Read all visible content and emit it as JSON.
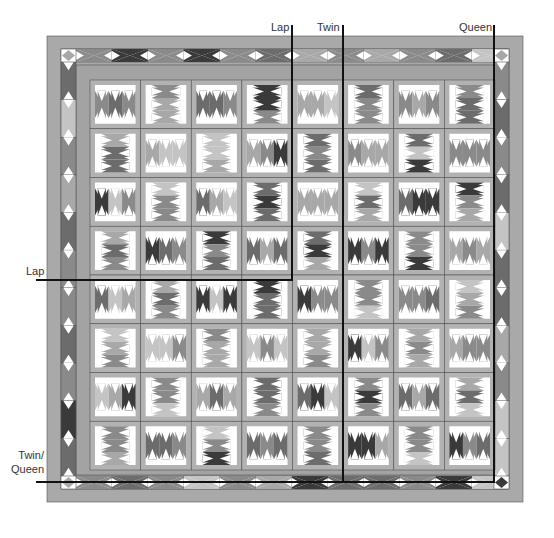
{
  "diagram": {
    "colors": {
      "outer_border": "#a9a9a9",
      "inner_border": "#a3a3a3",
      "sashing": "#b2b2b2",
      "background_white": "#ffffff",
      "light": "#c4c4c4",
      "medium_light": "#a8a8a8",
      "medium": "#8a8a8a",
      "medium_dark": "#6c6c6c",
      "dark": "#3a3a3a",
      "outline": "#555555",
      "cut_line": "#111111"
    },
    "grid": {
      "rows": 8,
      "columns": 8,
      "block_units_per_block": 3
    },
    "size_labels": {
      "top": [
        {
          "text": "Lap",
          "line": "lap-vertical"
        },
        {
          "text": "Twin",
          "line": "twin-vertical"
        },
        {
          "text": "Queen",
          "line": "queen-vertical"
        }
      ],
      "left": [
        {
          "text": "Lap",
          "line": "lap-horizontal"
        },
        {
          "text": "Twin/\nQueen",
          "line": "twin-queen-horizontal"
        }
      ]
    },
    "labels": {
      "lap_top": "Lap",
      "twin_top": "Twin",
      "queen_top": "Queen",
      "lap_left": "Lap",
      "twin_queen_left_1": "Twin/",
      "twin_queen_left_2": "Queen"
    }
  }
}
